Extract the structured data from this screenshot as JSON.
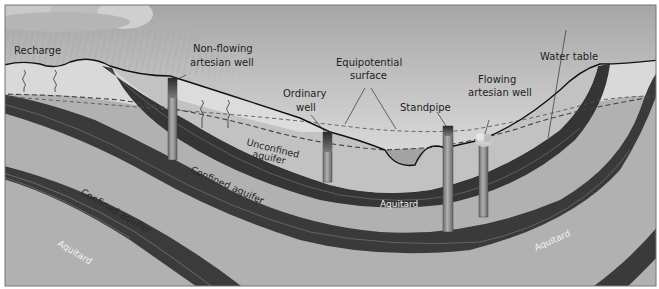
{
  "diagram": {
    "colors": {
      "sky_top": "#a9a9a9",
      "sky_bottom": "#f4f4f4",
      "unsaturated_zone": "#d6d6d6",
      "aquifer": "#b3b3b3",
      "aquitard": "#3a3a3a",
      "well_pipe": "#8a8a8a",
      "stream": "#a6a6a6",
      "surface_line": "#111111"
    },
    "labels": {
      "recharge": "Recharge",
      "non_flowing_line1": "Non-flowing",
      "non_flowing_line2": "artesian well",
      "equipotential_line1": "Equipotential",
      "equipotential_line2": "surface",
      "ordinary_line1": "Ordinary",
      "ordinary_line2": "well",
      "standpipe": "Standpipe",
      "flowing_line1": "Flowing",
      "flowing_line2": "artesian well",
      "water_table": "Water table",
      "unconfined_line1": "Unconfined",
      "unconfined_line2": "aquifer",
      "confined_upper": "Confined aquifer",
      "confined_lower": "Confined aquifer",
      "aquitard_center": "Aquitard",
      "aquitard_right": "Aquitard",
      "aquitard_left": "Aquitard"
    },
    "wells": [
      {
        "name": "Non-flowing artesian well"
      },
      {
        "name": "Ordinary well"
      },
      {
        "name": "Standpipe"
      },
      {
        "name": "Flowing artesian well"
      }
    ]
  }
}
